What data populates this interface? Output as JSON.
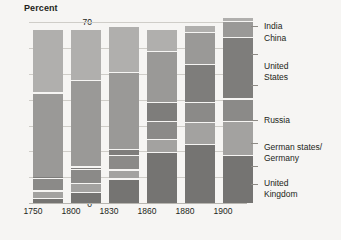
{
  "chart_data": {
    "type": "bar",
    "subtype": "stacked-bar",
    "title": "",
    "ylabel": "Percent",
    "xlabel": "",
    "ylim": [
      0,
      70
    ],
    "yticks": [
      0,
      10,
      20,
      30,
      40,
      50,
      60,
      70
    ],
    "grid": true,
    "legend_position": "right",
    "categories": [
      "1750",
      "1800",
      "1830",
      "1860",
      "1880",
      "1900"
    ],
    "series": [
      {
        "name": "United Kingdom",
        "color": "#757472",
        "values": [
          2.0,
          4.3,
          9.5,
          19.9,
          22.9,
          18.5
        ]
      },
      {
        "name": "German states/Germany",
        "color": "#a3a2a0",
        "values": [
          2.9,
          3.5,
          3.5,
          4.9,
          8.5,
          13.2
        ]
      },
      {
        "name": "Russia",
        "color": "#8b8a88",
        "values": [
          5.0,
          5.6,
          5.6,
          7.0,
          7.6,
          8.8
        ]
      },
      {
        "name": "United States",
        "color": "#7e7d7b",
        "values": [
          0.1,
          0.8,
          2.4,
          7.2,
          14.7,
          23.6
        ]
      },
      {
        "name": "China",
        "color": "#9a9997",
        "values": [
          32.8,
          33.3,
          29.8,
          19.7,
          12.5,
          6.2
        ]
      },
      {
        "name": "India",
        "color": "#b0afad",
        "values": [
          24.5,
          19.7,
          17.6,
          8.6,
          2.8,
          1.7
        ]
      }
    ],
    "legend_labels": [
      "India",
      "China",
      "United States",
      "Russia",
      "German states/\nGermany",
      "United\nKingdom"
    ],
    "bar_totals": [
      67.3,
      67.2,
      68.4,
      67.3,
      69.0,
      72.0
    ]
  },
  "axis": {
    "y_title": "Percent",
    "y_ticks": [
      "70",
      "60",
      "50",
      "40",
      "30",
      "20",
      "10",
      "0"
    ],
    "x_ticks": [
      "1750",
      "1800",
      "1830",
      "1860",
      "1880",
      "1900"
    ]
  },
  "legend": {
    "items": [
      {
        "line1": "India",
        "line2": ""
      },
      {
        "line1": "China",
        "line2": ""
      },
      {
        "line1": "United",
        "line2": "States"
      },
      {
        "line1": "Russia",
        "line2": ""
      },
      {
        "line1": "German states/",
        "line2": "Germany"
      },
      {
        "line1": "United",
        "line2": "Kingdom"
      }
    ]
  },
  "colors": {
    "background": "#f6f5f3",
    "gridline": "#cfcdc8",
    "baseline": "#b8b6b1",
    "leader": "#8d8a85",
    "text": "#231f20"
  }
}
